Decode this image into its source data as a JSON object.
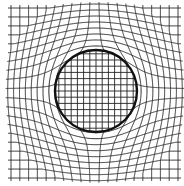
{
  "diagram": {
    "canvas": {
      "width": 184,
      "height": 186,
      "background": "#ffffff"
    },
    "outer_grid": {
      "x_min": 11,
      "x_max": 178,
      "y_min": 8,
      "y_max": 178,
      "lines_x": 20,
      "lines_y": 20,
      "stroke": "#2a2a2a",
      "stroke_width": 1.0,
      "tick_overhang": 3
    },
    "circle": {
      "cx": 96,
      "cy": 91,
      "r": 41,
      "stroke": "#111111",
      "stroke_width": 2.4
    },
    "inner_grid": {
      "spacing": 6.2,
      "stroke": "#222222",
      "stroke_width": 0.9
    },
    "distortion": {
      "strength": 1.0,
      "falloff_radius": 95
    }
  }
}
